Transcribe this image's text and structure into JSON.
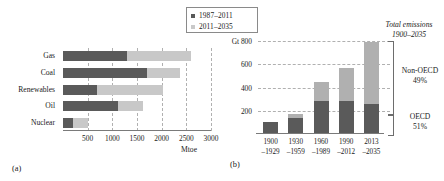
{
  "legend": {
    "items": [
      {
        "label": "1987–2011",
        "swatch": "dark",
        "color": "#595959"
      },
      {
        "label": "2011–2035",
        "swatch": "light",
        "color": "#c9c9c9"
      }
    ]
  },
  "panel_a": {
    "panel_label": "(a)",
    "unit_label": "Mtoe",
    "chart_data": {
      "type": "bar",
      "orientation": "horizontal",
      "stacked": true,
      "title": "",
      "xlabel": "Mtoe",
      "ylabel": "",
      "xlim": [
        0,
        3000
      ],
      "xticks": [
        500,
        1000,
        1500,
        2000,
        2500,
        3000
      ],
      "xticklabels": [
        "500",
        "1000",
        "1500",
        "2000",
        "2500",
        "3000"
      ],
      "grid": true,
      "legend_position": "top-right",
      "categories": [
        "Gas",
        "Coal",
        "Renewables",
        "Oil",
        "Nuclear"
      ],
      "series": [
        {
          "name": "1987–2011",
          "color": "#5a5a5a",
          "values": [
            1300,
            1700,
            680,
            1110,
            200
          ]
        },
        {
          "name": "2011–2035",
          "color": "#c8c8c8",
          "values": [
            1300,
            680,
            1350,
            520,
            300
          ]
        }
      ],
      "totals": [
        2600,
        2380,
        2030,
        1630,
        500
      ]
    }
  },
  "panel_b": {
    "panel_label": "(b)",
    "unit_prefix": "Gt",
    "annotations": {
      "total_title_line1": "Total emissions",
      "total_title_line2": "1900–2035",
      "non_oecd_label": "Non-OECD",
      "non_oecd_value": "49%",
      "oecd_label": "OECD",
      "oecd_value": "51%"
    },
    "chart_data": {
      "type": "bar",
      "orientation": "vertical",
      "stacked": true,
      "title": "",
      "xlabel": "",
      "ylabel": "Gt",
      "ylim": [
        0,
        800
      ],
      "yticks": [
        200,
        400,
        600,
        800
      ],
      "yticklabels": [
        "200",
        "400",
        "600",
        "Gt 800"
      ],
      "grid": true,
      "categories": [
        "1900\n–1929",
        "1930\n–1959",
        "1960\n–1989",
        "1990\n–2012",
        "2013\n–2035"
      ],
      "category_lines": [
        {
          "top": "1900",
          "bottom": "–1929"
        },
        {
          "top": "1930",
          "bottom": "–1959"
        },
        {
          "top": "1960",
          "bottom": "–1989"
        },
        {
          "top": "1990",
          "bottom": "–2012"
        },
        {
          "top": "2013",
          "bottom": "–2035"
        }
      ],
      "series": [
        {
          "name": "OECD",
          "color": "#5a5a5a",
          "values": [
            100,
            140,
            285,
            285,
            260
          ]
        },
        {
          "name": "Non-OECD",
          "color": "#b0b0b0",
          "values": [
            0,
            35,
            165,
            280,
            530
          ]
        }
      ],
      "totals": [
        100,
        175,
        450,
        565,
        790
      ]
    }
  }
}
